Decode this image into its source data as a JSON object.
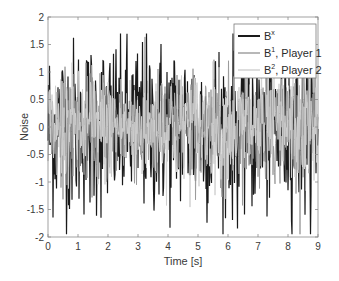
{
  "chart_data": {
    "type": "line",
    "title": "",
    "xlabel": "Time [s]",
    "ylabel": "Noise",
    "xlim": [
      0,
      9
    ],
    "ylim": [
      -2,
      2
    ],
    "xticks": [
      0,
      1,
      2,
      3,
      4,
      5,
      6,
      7,
      8,
      9
    ],
    "yticks": [
      -2,
      -1.5,
      -1,
      -0.5,
      0,
      0.5,
      1,
      1.5,
      2
    ],
    "xtick_labels": [
      "0",
      "1",
      "2",
      "3",
      "4",
      "5",
      "6",
      "7",
      "8",
      "9"
    ],
    "ytick_labels": [
      "-2",
      "-1.5",
      "-1",
      "-0.5",
      "0",
      "0.5",
      "1",
      "1.5",
      "2"
    ],
    "grid": false,
    "legend_position": "upper right",
    "series": [
      {
        "name": "B^x",
        "label_base": "B",
        "label_sup": "x",
        "label_suffix": "",
        "color": "#1a1a1a",
        "amplitude_approx": 1.6,
        "description": "dense random noise, roughly within [-1.9, 1.65]"
      },
      {
        "name": "B^1, Player 1",
        "label_base": "B",
        "label_sup": "1",
        "label_suffix": ", Player 1",
        "color": "#9a9a9a",
        "amplitude_approx": 1.2,
        "description": "dense random noise, mostly within [-1.2, 1.2]"
      },
      {
        "name": "B^2, Player 2",
        "label_base": "B",
        "label_sup": "2",
        "label_suffix": ", Player 2",
        "color": "#cfcfcf",
        "amplitude_approx": 1.2,
        "description": "dense random noise, mostly within [-1.2, 1.2]"
      }
    ],
    "samples_per_second": 60
  }
}
